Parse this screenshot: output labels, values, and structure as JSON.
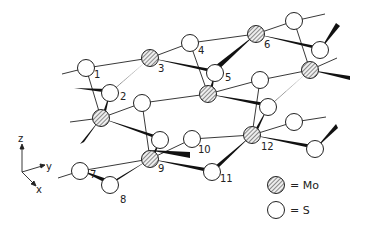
{
  "figure": {
    "type": "crystal-structure-diagram",
    "atom_labels": [
      "1",
      "2",
      "3",
      "4",
      "5",
      "6",
      "7",
      "8",
      "9",
      "10",
      "11",
      "12"
    ],
    "axes": {
      "z": "z",
      "y": "y",
      "x": "x"
    },
    "legend": [
      {
        "symbol": "hatched-circle",
        "label": "= Mo"
      },
      {
        "symbol": "open-circle",
        "label": "= S"
      }
    ]
  }
}
